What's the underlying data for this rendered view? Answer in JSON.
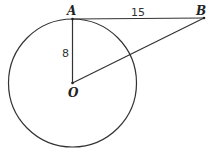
{
  "diagram": {
    "points": {
      "A": {
        "label": "A"
      },
      "B": {
        "label": "B"
      },
      "O": {
        "label": "O"
      }
    },
    "segments": [
      {
        "from": "A",
        "to": "B",
        "label": "15"
      },
      {
        "from": "A",
        "to": "O",
        "label": "8"
      },
      {
        "from": "O",
        "to": "B",
        "label": ""
      }
    ],
    "circle": {
      "center": "O",
      "radius_value": "8"
    }
  }
}
